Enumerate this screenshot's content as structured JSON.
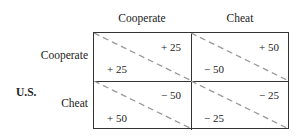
{
  "column_player_actions": [
    "Cooperate",
    "Cheat"
  ],
  "row_player": {
    "label": "U.S.",
    "actions": [
      "Cooperate",
      "Cheat"
    ]
  },
  "payoffs": [
    [
      {
        "top_right": "+ 25",
        "bottom_left": "+ 25"
      },
      {
        "top_right": "+ 50",
        "bottom_left": "− 50"
      }
    ],
    [
      {
        "top_right": "− 50",
        "bottom_left": "+ 50"
      },
      {
        "top_right": "− 25",
        "bottom_left": "− 25"
      }
    ]
  ],
  "colors": {
    "diagonal": "#999999",
    "border": "#333333"
  }
}
